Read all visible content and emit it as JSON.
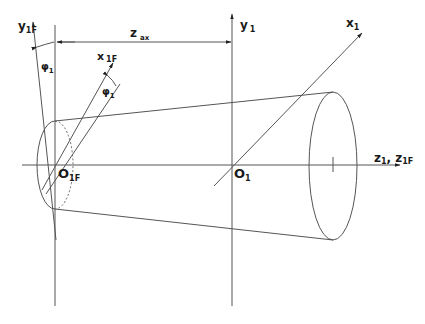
{
  "diagram": {
    "type": "technical-drawing",
    "labels": {
      "y1f": "y",
      "y1f_sub": "1F",
      "phi1_left": "φ",
      "phi1_left_sub": "1",
      "z_ax": "z",
      "z_ax_sub": "ax",
      "x1f": "x",
      "x1f_sub": "1F",
      "phi1_right": "φ",
      "phi1_right_sub": "1",
      "y1": "y",
      "y1_sub": "1",
      "x1": "x",
      "x1_sub": "1",
      "o1f": "O",
      "o1f_sub": "1F",
      "o1": "O",
      "o1_sub": "1",
      "z_axis": "z",
      "z_axis_sub1": "1",
      "z_axis_sep": ", ",
      "z_axis2": "z",
      "z_axis_sub2": "1F"
    },
    "colors": {
      "line": "#555555",
      "text": "#1a1a1a",
      "background": "#ffffff"
    }
  }
}
